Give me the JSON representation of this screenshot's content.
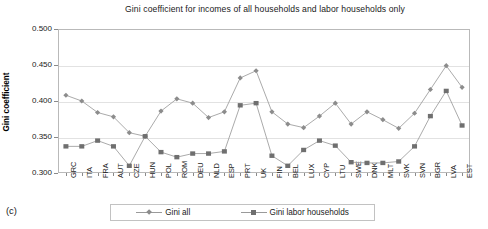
{
  "figure": {
    "caption": "(c)"
  },
  "legend": {
    "position": "bottom-center",
    "entries": [
      {
        "label": "Gini all",
        "marker": "diamond",
        "color": "#8c8c8c"
      },
      {
        "label": "Gini labor households",
        "marker": "square",
        "color": "#6f6f6f"
      }
    ]
  },
  "chart_data": {
    "type": "line",
    "title": "Gini coefficient for incomes of all households and labor households only",
    "xlabel": "",
    "ylabel": "Gini coefficient",
    "ylim": [
      0.3,
      0.5
    ],
    "yticks": [
      "0.300",
      "0.350",
      "0.400",
      "0.450",
      "0.500"
    ],
    "ytick_values": [
      0.3,
      0.35,
      0.4,
      0.45,
      0.5
    ],
    "grid": true,
    "categories": [
      "GRC",
      "ITA",
      "FRA",
      "AUT",
      "CZE",
      "HUN",
      "POL",
      "ROM",
      "DEU",
      "NLD",
      "ESP",
      "PRT",
      "UK",
      "FIN",
      "BEL",
      "LUX",
      "CYP",
      "LTU",
      "SWE",
      "DNK",
      "MLT",
      "SVK",
      "SVN",
      "BGR",
      "LVA",
      "EST"
    ],
    "series": [
      {
        "name": "Gini all",
        "marker": "diamond",
        "color": "#8c8c8c",
        "values": [
          0.408,
          0.4,
          0.384,
          0.378,
          0.356,
          0.351,
          0.386,
          0.403,
          0.397,
          0.377,
          0.385,
          0.432,
          0.442,
          0.385,
          0.368,
          0.363,
          0.379,
          0.397,
          0.368,
          0.385,
          0.374,
          0.362,
          0.383,
          0.416,
          0.449,
          0.419
        ]
      },
      {
        "name": "Gini labor households",
        "marker": "square",
        "color": "#6f6f6f",
        "values": [
          0.337,
          0.337,
          0.345,
          0.337,
          0.31,
          0.351,
          0.329,
          0.322,
          0.327,
          0.327,
          0.33,
          0.394,
          0.397,
          0.324,
          0.31,
          0.332,
          0.345,
          0.338,
          0.315,
          0.314,
          0.314,
          0.316,
          0.337,
          0.379,
          0.414,
          0.366
        ]
      }
    ]
  }
}
